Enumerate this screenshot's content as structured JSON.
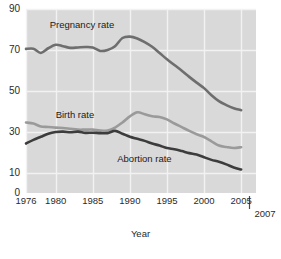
{
  "chart_data": {
    "type": "line",
    "title": "",
    "xlabel": "Year",
    "ylabel": "",
    "xlim": [
      1976,
      2007
    ],
    "ylim": [
      0,
      90
    ],
    "grid": true,
    "legend_position": "inline-annotations",
    "background": "#d9d9d9",
    "xticks": [
      "1976",
      "1980",
      "1985",
      "1990",
      "1995",
      "2000",
      "2005",
      "2007"
    ],
    "xtick_values": [
      1976,
      1980,
      1985,
      1990,
      1995,
      2000,
      2005,
      2007
    ],
    "yticks": [
      "0",
      "10",
      "30",
      "50",
      "70",
      "90"
    ],
    "ytick_values": [
      0,
      10,
      30,
      50,
      70,
      90
    ],
    "x": [
      1976,
      1977,
      1978,
      1979,
      1980,
      1981,
      1982,
      1983,
      1984,
      1985,
      1986,
      1987,
      1988,
      1989,
      1990,
      1991,
      1992,
      1993,
      1994,
      1995,
      1996,
      1997,
      1998,
      1999,
      2000,
      2001,
      2002,
      2003,
      2004,
      2005
    ],
    "series": [
      {
        "name": "Pregnancy rate",
        "color": "#6e6e6e",
        "label_x": 1979.2,
        "label_y": 82,
        "values": [
          70.5,
          70.6,
          68.5,
          70.8,
          72.5,
          71.8,
          71.0,
          71.2,
          71.4,
          71.2,
          69.5,
          70.0,
          71.8,
          75.8,
          76.5,
          75.6,
          73.8,
          71.5,
          68.5,
          65.4,
          62.6,
          59.8,
          56.8,
          54.0,
          51.3,
          47.8,
          44.9,
          43.0,
          41.5,
          40.5
        ]
      },
      {
        "name": "Birth rate",
        "color": "#9a9a9a",
        "label_x": 1980.0,
        "label_y": 38,
        "values": [
          34.5,
          34.0,
          32.5,
          32.3,
          32.0,
          31.8,
          31.4,
          31.0,
          31.0,
          31.0,
          30.5,
          30.6,
          32.0,
          34.5,
          37.5,
          39.5,
          38.5,
          37.5,
          37.2,
          36.0,
          34.0,
          32.2,
          30.4,
          28.7,
          27.4,
          25.3,
          23.2,
          22.5,
          22.0,
          22.4
        ]
      },
      {
        "name": "Abortion rate",
        "color": "#3c3c3c",
        "label_x": 1988.3,
        "label_y": 16.5,
        "values": [
          24.2,
          26.0,
          27.5,
          29.0,
          29.8,
          30.0,
          29.7,
          30.0,
          29.4,
          29.5,
          29.3,
          29.3,
          30.4,
          29.0,
          27.5,
          26.5,
          25.5,
          24.2,
          23.2,
          22.0,
          21.4,
          20.5,
          19.5,
          18.8,
          17.5,
          16.2,
          15.3,
          14.0,
          12.5,
          11.5
        ]
      }
    ]
  },
  "geometry": {
    "plot_left": 26,
    "plot_right": 256,
    "plot_top": 9,
    "plot_bottom": 193
  },
  "axis": {
    "x_title": "Year",
    "end_year_label": "2007"
  }
}
